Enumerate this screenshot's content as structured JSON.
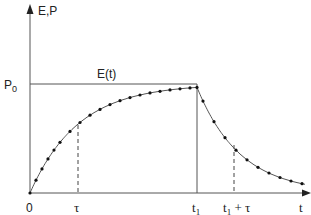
{
  "diagram": {
    "y_axis_label": "E,P",
    "x_axis_label": "t",
    "level_label": "P",
    "level_sub": "0",
    "curve_label": "E(t)",
    "x_ticks": {
      "origin": "0",
      "tau": "τ",
      "t1": "t",
      "t1_sub": "1",
      "t1_plus_tau_suffix": " + τ"
    }
  },
  "chart_data": {
    "type": "line",
    "title": "",
    "xlabel": "t",
    "ylabel": "E,P",
    "series": [
      {
        "name": "E(t) rise",
        "description": "exponential approach to P0 from t=0 to t1"
      },
      {
        "name": "E(t) decay",
        "description": "exponential decay after t1"
      }
    ],
    "reference_lines": [
      "P0 horizontal level",
      "tau",
      "t1",
      "t1 + tau"
    ]
  }
}
